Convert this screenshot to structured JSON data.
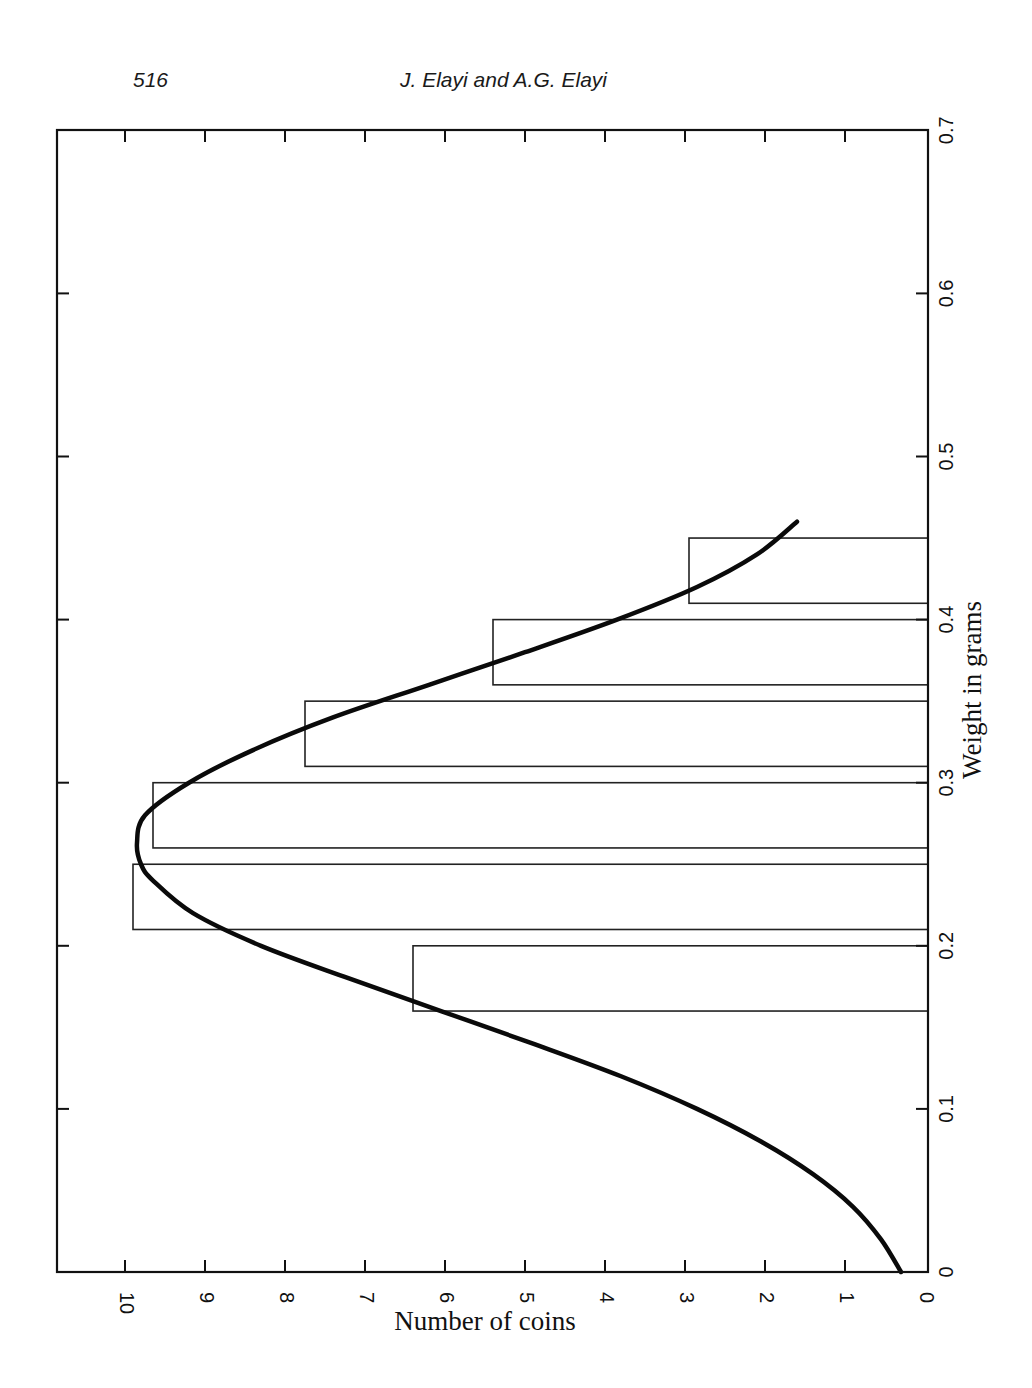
{
  "page": {
    "number": "516",
    "running_head": "J. Elayi and A.G. Elayi"
  },
  "chart_data": {
    "type": "bar",
    "orientation": "rotated-90 (page printed sideways; weight axis vertical on right, count axis horizontal at bottom increasing leftward)",
    "title": "",
    "xlabel": "Weight in grams",
    "ylabel": "Number of coins",
    "xlim": [
      0,
      0.7
    ],
    "ylim": [
      0,
      10.85
    ],
    "x_ticks": [
      0,
      0.1,
      0.2,
      0.3,
      0.4,
      0.5,
      0.6,
      0.7
    ],
    "x_tick_labels": [
      "0",
      "0.1",
      "0.2",
      "0.3",
      "0.4",
      "0.5",
      "0.6",
      "0.7"
    ],
    "y_ticks": [
      0,
      1,
      2,
      3,
      4,
      5,
      6,
      7,
      8,
      9,
      10
    ],
    "y_tick_labels": [
      "0",
      "1",
      "2",
      "3",
      "4",
      "5",
      "6",
      "7",
      "8",
      "9",
      "10"
    ],
    "grid": false,
    "legend": null,
    "bars": [
      {
        "x_start": 0.16,
        "x_end": 0.2,
        "value": 6.4
      },
      {
        "x_start": 0.21,
        "x_end": 0.25,
        "value": 9.9
      },
      {
        "x_start": 0.26,
        "x_end": 0.3,
        "value": 9.65
      },
      {
        "x_start": 0.31,
        "x_end": 0.35,
        "value": 7.75
      },
      {
        "x_start": 0.36,
        "x_end": 0.4,
        "value": 5.4
      },
      {
        "x_start": 0.41,
        "x_end": 0.45,
        "value": 2.95
      }
    ],
    "categories": [
      "0.16-0.20",
      "0.21-0.25",
      "0.26-0.30",
      "0.31-0.35",
      "0.36-0.40",
      "0.41-0.45"
    ],
    "values": [
      6.4,
      9.9,
      9.65,
      7.75,
      5.4,
      2.95
    ],
    "series": [
      {
        "name": "Normal fit",
        "type": "line",
        "x": [
          0.0,
          0.02,
          0.04,
          0.06,
          0.08,
          0.1,
          0.12,
          0.14,
          0.16,
          0.18,
          0.2,
          0.22,
          0.24,
          0.25,
          0.263,
          0.28,
          0.3,
          0.32,
          0.34,
          0.36,
          0.38,
          0.4,
          0.42,
          0.44,
          0.46
        ],
        "values": [
          0.3,
          0.55,
          0.9,
          1.4,
          2.05,
          2.85,
          3.8,
          4.9,
          6.05,
          7.2,
          8.3,
          9.15,
          9.65,
          9.8,
          9.85,
          9.75,
          9.2,
          8.4,
          7.4,
          6.2,
          5.0,
          3.85,
          2.85,
          2.1,
          1.6
        ]
      }
    ]
  }
}
